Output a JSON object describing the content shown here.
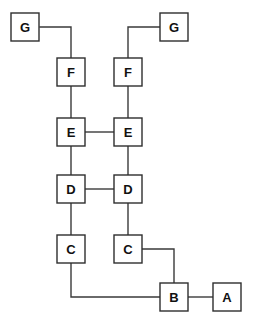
{
  "diagram": {
    "type": "node-link-diagram",
    "canvas": {
      "width": 257,
      "height": 318,
      "background": "#ffffff"
    },
    "style": {
      "node_fill": "#ffffff",
      "node_stroke": "#2e2e2e",
      "edge_stroke": "#3a3a3a",
      "label_color": "#111111",
      "node_width": 28,
      "node_height": 28,
      "stroke_width": 1.4
    },
    "nodes": [
      {
        "id": "G1",
        "label": "G",
        "x": 11,
        "y": 13,
        "w": 28,
        "h": 28,
        "column": "left-outer",
        "row": "G"
      },
      {
        "id": "G2",
        "label": "G",
        "x": 160,
        "y": 13,
        "w": 28,
        "h": 28,
        "column": "right-outer",
        "row": "G"
      },
      {
        "id": "F1",
        "label": "F",
        "x": 57,
        "y": 58,
        "w": 28,
        "h": 28,
        "column": "left",
        "row": "F"
      },
      {
        "id": "F2",
        "label": "F",
        "x": 114,
        "y": 58,
        "w": 28,
        "h": 28,
        "column": "right",
        "row": "F"
      },
      {
        "id": "E1",
        "label": "E",
        "x": 57,
        "y": 118,
        "w": 28,
        "h": 28,
        "column": "left",
        "row": "E"
      },
      {
        "id": "E2",
        "label": "E",
        "x": 114,
        "y": 118,
        "w": 28,
        "h": 28,
        "column": "right",
        "row": "E"
      },
      {
        "id": "D1",
        "label": "D",
        "x": 57,
        "y": 175,
        "w": 28,
        "h": 28,
        "column": "left",
        "row": "D"
      },
      {
        "id": "D2",
        "label": "D",
        "x": 114,
        "y": 175,
        "w": 28,
        "h": 28,
        "column": "right",
        "row": "D"
      },
      {
        "id": "C1",
        "label": "C",
        "x": 57,
        "y": 235,
        "w": 28,
        "h": 28,
        "column": "left",
        "row": "C"
      },
      {
        "id": "C2",
        "label": "C",
        "x": 114,
        "y": 235,
        "w": 28,
        "h": 28,
        "column": "right",
        "row": "C"
      },
      {
        "id": "B1",
        "label": "B",
        "x": 160,
        "y": 283,
        "w": 28,
        "h": 28,
        "column": "right-outer",
        "row": "B"
      },
      {
        "id": "A1",
        "label": "A",
        "x": 213,
        "y": 283,
        "w": 28,
        "h": 28,
        "column": "far-right",
        "row": "A"
      }
    ],
    "edges": [
      {
        "id": "e-G1-F1",
        "from": "G1",
        "to": "F1",
        "path": "M 40,27 L 71,27 L 71,58"
      },
      {
        "id": "e-G2-F2",
        "from": "G2",
        "to": "F2",
        "path": "M 160,27 L 128,27 L 128,58"
      },
      {
        "id": "e-F1-E1",
        "from": "F1",
        "to": "E1",
        "path": "M 71,86 L 71,118"
      },
      {
        "id": "e-F2-E2",
        "from": "F2",
        "to": "E2",
        "path": "M 128,86 L 128,118"
      },
      {
        "id": "e-E1-E2",
        "from": "E1",
        "to": "E2",
        "path": "M 85,132 L 114,132"
      },
      {
        "id": "e-E1-D1",
        "from": "E1",
        "to": "D1",
        "path": "M 71,146 L 71,175"
      },
      {
        "id": "e-E2-D2",
        "from": "E2",
        "to": "D2",
        "path": "M 128,146 L 128,175"
      },
      {
        "id": "e-D1-D2",
        "from": "D1",
        "to": "D2",
        "path": "M 85,189 L 114,189"
      },
      {
        "id": "e-D1-C1",
        "from": "D1",
        "to": "C1",
        "path": "M 71,203 L 71,235"
      },
      {
        "id": "e-D2-C2",
        "from": "D2",
        "to": "C2",
        "path": "M 128,203 L 128,235"
      },
      {
        "id": "e-C1-B1",
        "from": "C1",
        "to": "B1",
        "path": "M 71,263 L 71,297 L 160,297"
      },
      {
        "id": "e-C2-B1",
        "from": "C2",
        "to": "B1",
        "path": "M 142,249 L 174,249 L 174,283"
      },
      {
        "id": "e-B1-A1",
        "from": "B1",
        "to": "A1",
        "path": "M 188,297 L 213,297"
      }
    ]
  }
}
